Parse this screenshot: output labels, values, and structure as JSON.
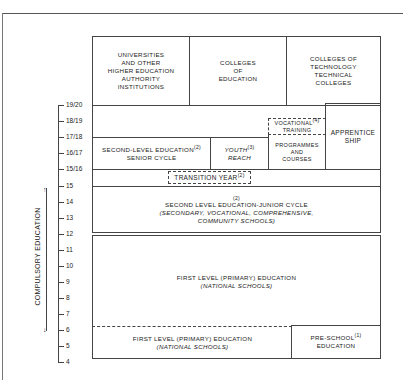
{
  "age_axis": {
    "ticks": [
      "19/20",
      "18/19",
      "17/18",
      "16/17",
      "15/16",
      "15",
      "14",
      "13",
      "12",
      "11",
      "10",
      "9",
      "8",
      "7",
      "6",
      "5",
      "4"
    ]
  },
  "compulsory": {
    "label": "COMPULSORY EDUCATION"
  },
  "third_level": {
    "universities": [
      "UNIVERSITIES",
      "AND OTHER",
      "HIGHER EDUCATION",
      "AUTHORITY",
      "INSTITUTIONS"
    ],
    "colleges_education": [
      "COLLEGES",
      "OF",
      "EDUCATION"
    ],
    "colleges_technology": [
      "COLLEGES OF",
      "TECHNOLOGY",
      "TECHNICAL",
      "COLLEGES"
    ]
  },
  "senior_cycle": {
    "line1": "SECOND-LEVEL EDUCATION",
    "line2": "SENIOR CYCLE",
    "note": "(2)"
  },
  "youth_reach": {
    "line1": "YOUTH",
    "line2": "REACH",
    "note": "(3)"
  },
  "vocational": {
    "line1": "VOCATIONAL",
    "line2": "TRAINING",
    "note": "(4)",
    "sub1": "PROGRAMMES",
    "sub2": "AND",
    "sub3": "COURSES"
  },
  "apprentice": {
    "line1": "APPRENTICE",
    "line2": "SHIP"
  },
  "transition_year": {
    "label": "TRANSITION YEAR",
    "note": "(2)"
  },
  "junior_cycle": {
    "note": "(2)",
    "title": "SECOND LEVEL EDUCATION-JUNIOR CYCLE",
    "sub1": "(SECONDARY, VOCATIONAL, COMPREHENSIVE,",
    "sub2": "COMMUNITY SCHOOLS)"
  },
  "first_level_upper": {
    "title": "FIRST LEVEL (PRIMARY) EDUCATION",
    "sub": "(NATIONAL SCHOOLS)"
  },
  "first_level_lower": {
    "title": "FIRST LEVEL (PRIMARY) EDUCATION",
    "sub": "(NATIONAL SCHOOLS)"
  },
  "pre_school": {
    "line1": "PRE-SCHOOL",
    "line2": "EDUCATION",
    "note": "(1)"
  }
}
